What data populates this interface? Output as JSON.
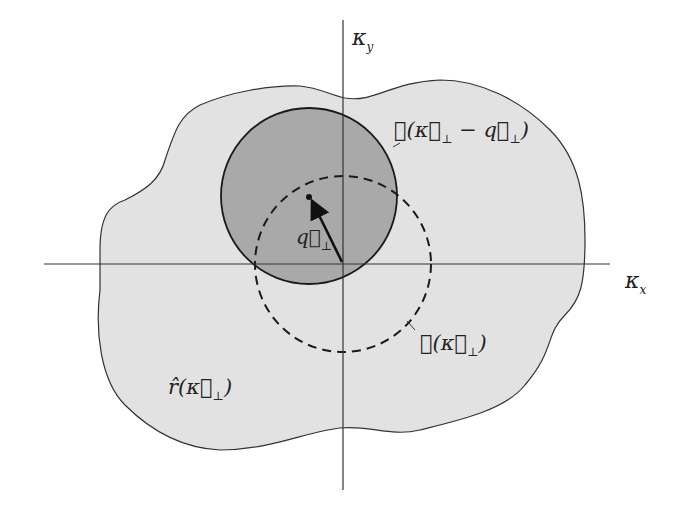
{
  "diagram": {
    "type": "k-space overlap sketch",
    "axes": {
      "x_label": "κ",
      "x_sub": "x",
      "y_label": "κ",
      "y_sub": "y"
    },
    "regions": {
      "blob_label_base": "r̂(κ⃗",
      "blob_label_sub": "⊥",
      "blob_label_close": ")",
      "solid_circle_label_pre": "𝓗(κ⃗",
      "solid_circle_label_sub1": "⊥",
      "solid_circle_label_mid": " − q⃗",
      "solid_circle_label_sub2": "⊥",
      "solid_circle_label_close": ")",
      "dashed_circle_label_pre": "𝓗(κ⃗",
      "dashed_circle_label_sub": "⊥",
      "dashed_circle_label_close": ")"
    },
    "vector": {
      "label": "q⃗",
      "label_sub": "⊥"
    },
    "colors": {
      "blob_fill": "#e2e2e2",
      "solid_circle_fill": "#a9a9a9",
      "stroke": "#222222",
      "background": "#ffffff"
    }
  }
}
